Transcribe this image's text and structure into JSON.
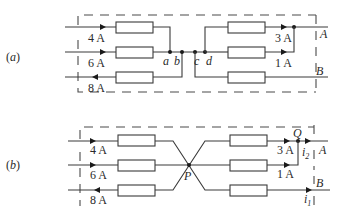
{
  "diagram_a": {
    "label": "(a)",
    "currents": {
      "in1": "4 A",
      "in2": "6 A",
      "out3": "8 A",
      "right1": "3 A",
      "right2": "1 A"
    },
    "nodes": {
      "a": "a",
      "b": "b",
      "c": "c",
      "d": "d"
    },
    "terminals": {
      "A": "A",
      "B": "B"
    }
  },
  "diagram_b": {
    "label": "(b)",
    "currents": {
      "in1": "4 A",
      "in2": "6 A",
      "out3": "8 A",
      "right1": "3 A",
      "right2": "1 A",
      "i2": "i",
      "i2_sub": "2",
      "i1": "i",
      "i1_sub": "1"
    },
    "nodes": {
      "P": "P",
      "Q": "Q"
    },
    "terminals": {
      "A": "A",
      "B": "B"
    }
  },
  "colors": {
    "line": "#3a3a3a",
    "node": "#1a1a1a",
    "background": "#ffffff"
  }
}
